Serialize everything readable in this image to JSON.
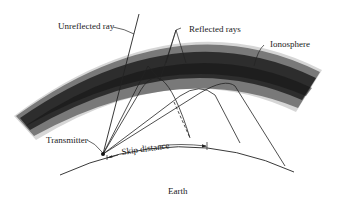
{
  "figure": {
    "type": "ionospheric skip propagation diagram",
    "labels": {
      "unreflected_ray": "Unreflected ray",
      "reflected_rays": "Reflected rays",
      "ionosphere": "Ionosphere",
      "transmitter": "Transmitter",
      "skip_distance": "Skip distance",
      "earth": "Earth"
    },
    "colors": {
      "background": "#ffffff",
      "ionosphere_core": "#1c1c1c",
      "ionosphere_edge": "#bdbdbd",
      "lines": "#222222",
      "text": "#1a1a1a"
    },
    "elements": {
      "ionosphere_band": "curved dark gradient band (arc)",
      "earth_surface": "curved line (arc)",
      "transmitter_point": "dot on earth surface",
      "rays": [
        "unreflected ray passing through ionosphere",
        "reflected ray (steep)",
        "reflected ray (medium)",
        "reflected ray (shallow)",
        "reflected ray (grazing)"
      ],
      "skip_distance_marker": "arrowed dimension line along earth surface",
      "dashed_line": "dashed ray segment marking skip boundary"
    }
  }
}
